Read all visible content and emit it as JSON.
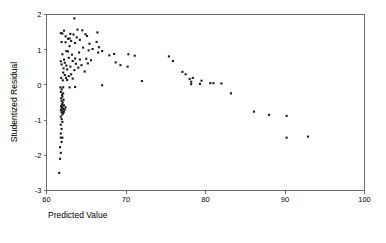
{
  "chart_data": {
    "type": "scatter",
    "title": "",
    "xlabel": "Predicted Value",
    "ylabel": "Studentized Residual",
    "xlim": [
      60,
      100
    ],
    "ylim": [
      -3,
      2
    ],
    "xticks": [
      60,
      70,
      80,
      90,
      100
    ],
    "xtick_labels": [
      "60",
      "70",
      "80",
      "90",
      "100"
    ],
    "yticks": [
      2,
      1,
      0,
      -1,
      -2,
      -3
    ],
    "ytick_labels": [
      "2",
      "1",
      "0",
      "-1",
      "-2",
      "-3"
    ],
    "grid": false,
    "legend": null,
    "marker": "filled-square",
    "marker_color": "#1a1a1a",
    "marker_size_px": 2.1,
    "points": [
      [
        61.6,
        -2.5
      ],
      [
        61.7,
        -2.1
      ],
      [
        61.8,
        -1.93
      ],
      [
        61.7,
        -1.77
      ],
      [
        61.9,
        -1.62
      ],
      [
        61.8,
        -1.5
      ],
      [
        62.0,
        -1.5
      ],
      [
        61.8,
        -1.38
      ],
      [
        61.9,
        -1.25
      ],
      [
        61.8,
        -1.13
      ],
      [
        62.0,
        -1.05
      ],
      [
        61.9,
        -0.97
      ],
      [
        61.8,
        -0.9
      ],
      [
        62.0,
        -0.84
      ],
      [
        62.1,
        -0.8
      ],
      [
        61.9,
        -0.78
      ],
      [
        62.2,
        -0.76
      ],
      [
        62.0,
        -0.73
      ],
      [
        61.8,
        -0.72
      ],
      [
        62.3,
        -0.7
      ],
      [
        62.1,
        -0.68
      ],
      [
        61.9,
        -0.66
      ],
      [
        62.4,
        -0.64
      ],
      [
        62.0,
        -0.62
      ],
      [
        61.85,
        -0.6
      ],
      [
        62.2,
        -0.58
      ],
      [
        61.95,
        -0.55
      ],
      [
        62.05,
        -0.5
      ],
      [
        61.9,
        -0.45
      ],
      [
        62.15,
        -0.42
      ],
      [
        61.85,
        -0.38
      ],
      [
        62.0,
        -0.33
      ],
      [
        61.95,
        -0.28
      ],
      [
        62.1,
        -0.24
      ],
      [
        61.8,
        -0.2
      ],
      [
        61.9,
        -0.13
      ],
      [
        61.75,
        -0.07
      ],
      [
        62.1,
        -0.07
      ],
      [
        62.9,
        -0.07
      ],
      [
        63.6,
        -0.06
      ],
      [
        67.0,
        -0.01
      ],
      [
        72.0,
        0.11
      ],
      [
        79.3,
        0.03
      ],
      [
        80.6,
        0.05
      ],
      [
        81.0,
        0.05
      ],
      [
        82.0,
        0.04
      ],
      [
        78.2,
        0.02
      ],
      [
        78.2,
        0.09
      ],
      [
        79.5,
        0.12
      ],
      [
        78.0,
        0.17
      ],
      [
        78.4,
        0.2
      ],
      [
        83.2,
        -0.24
      ],
      [
        86.1,
        -0.76
      ],
      [
        88.0,
        -0.85
      ],
      [
        90.2,
        -0.88
      ],
      [
        90.2,
        -1.5
      ],
      [
        92.9,
        -1.47
      ],
      [
        77.5,
        0.3
      ],
      [
        77.1,
        0.37
      ],
      [
        75.9,
        0.68
      ],
      [
        75.4,
        0.81
      ],
      [
        71.1,
        0.83
      ],
      [
        70.3,
        0.87
      ],
      [
        70.2,
        0.52
      ],
      [
        69.3,
        0.56
      ],
      [
        68.7,
        0.64
      ],
      [
        68.5,
        0.88
      ],
      [
        67.9,
        0.84
      ],
      [
        67.0,
        0.96
      ],
      [
        66.5,
        0.92
      ],
      [
        66.6,
        1.07
      ],
      [
        66.4,
        1.49
      ],
      [
        66.3,
        1.22
      ],
      [
        65.8,
        1.02
      ],
      [
        65.6,
        0.7
      ],
      [
        65.3,
        0.98
      ],
      [
        65.1,
        1.39
      ],
      [
        64.9,
        1.44
      ],
      [
        64.6,
        1.06
      ],
      [
        64.5,
        1.55
      ],
      [
        64.2,
        1.28
      ],
      [
        64.1,
        0.92
      ],
      [
        63.9,
        1.57
      ],
      [
        63.8,
        1.35
      ],
      [
        63.6,
        1.19
      ],
      [
        63.5,
        1.89
      ],
      [
        63.4,
        1.43
      ],
      [
        63.3,
        0.68
      ],
      [
        63.1,
        1.25
      ],
      [
        63.0,
        0.52
      ],
      [
        62.9,
        1.1
      ],
      [
        62.8,
        0.77
      ],
      [
        62.7,
        1.31
      ],
      [
        62.6,
        0.44
      ],
      [
        62.5,
        0.96
      ],
      [
        62.4,
        1.21
      ],
      [
        62.3,
        0.63
      ],
      [
        62.2,
        1.54
      ],
      [
        62.1,
        0.35
      ],
      [
        62.0,
        0.87
      ],
      [
        62.0,
        1.46
      ],
      [
        61.9,
        0.58
      ],
      [
        61.9,
        1.22
      ],
      [
        61.85,
        0.2
      ],
      [
        61.8,
        0.67
      ],
      [
        61.8,
        1.47
      ],
      [
        62.05,
        0.13
      ],
      [
        62.15,
        0.47
      ],
      [
        62.3,
        0.28
      ],
      [
        62.45,
        0.2
      ],
      [
        62.6,
        0.14
      ],
      [
        62.8,
        0.25
      ],
      [
        63.1,
        0.3
      ],
      [
        63.3,
        0.18
      ],
      [
        63.5,
        0.42
      ],
      [
        63.7,
        0.6
      ],
      [
        64.0,
        0.49
      ],
      [
        64.4,
        0.56
      ],
      [
        64.8,
        0.38
      ],
      [
        65.2,
        0.61
      ],
      [
        62.2,
        0.72
      ],
      [
        62.5,
        0.55
      ],
      [
        62.7,
        0.95
      ],
      [
        62.9,
        1.32
      ],
      [
        63.2,
        0.86
      ],
      [
        63.6,
        0.75
      ],
      [
        64.2,
        0.72
      ],
      [
        65.0,
        0.74
      ],
      [
        65.4,
        1.17
      ],
      [
        63.0,
        1.45
      ],
      [
        62.4,
        1.38
      ]
    ]
  }
}
